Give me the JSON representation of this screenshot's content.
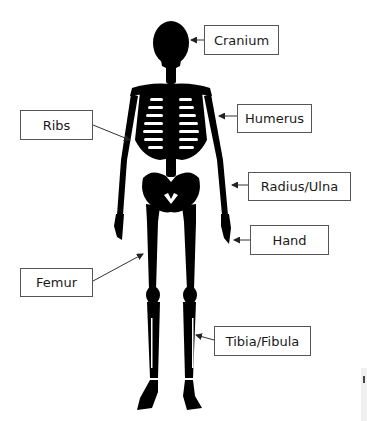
{
  "diagram": {
    "colors": {
      "bone": "#000000",
      "background": "#ffffff",
      "box_border": "#555555",
      "text": "#1a1a1a",
      "arrow": "#333333"
    },
    "labels": [
      {
        "id": "cranium",
        "text": "Cranium",
        "box": [
          204,
          25,
          75,
          30
        ],
        "arrow_from": [
          204,
          40
        ],
        "arrow_to": [
          190,
          40
        ]
      },
      {
        "id": "ribs",
        "text": "Ribs",
        "box": [
          20,
          110,
          73,
          30
        ],
        "arrow_from": [
          93,
          125
        ],
        "arrow_to": [
          130,
          140
        ]
      },
      {
        "id": "humerus",
        "text": "Humerus",
        "box": [
          237,
          104,
          75,
          29
        ],
        "arrow_from": [
          237,
          116
        ],
        "arrow_to": [
          218,
          116
        ]
      },
      {
        "id": "radius-ulna",
        "text": "Radius/Ulna",
        "box": [
          248,
          172,
          103,
          29
        ],
        "arrow_from": [
          248,
          185
        ],
        "arrow_to": [
          231,
          185
        ]
      },
      {
        "id": "hand",
        "text": "Hand",
        "box": [
          250,
          225,
          79,
          30
        ],
        "arrow_from": [
          250,
          240
        ],
        "arrow_to": [
          233,
          240
        ]
      },
      {
        "id": "femur",
        "text": "Femur",
        "box": [
          20,
          268,
          73,
          29
        ],
        "arrow_from": [
          93,
          281
        ],
        "arrow_to": [
          143,
          254
        ]
      },
      {
        "id": "tibia-fibula",
        "text": "Tibia/Fibula",
        "box": [
          214,
          326,
          97,
          30
        ],
        "arrow_from": [
          214,
          340
        ],
        "arrow_to": [
          195,
          335
        ]
      }
    ]
  }
}
